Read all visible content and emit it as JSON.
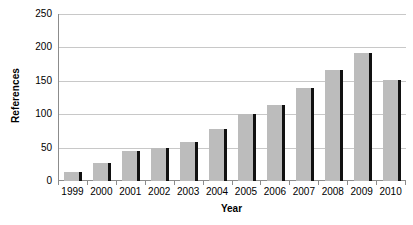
{
  "chart_data": {
    "type": "bar",
    "title": "",
    "xlabel": "Year",
    "ylabel": "References",
    "categories": [
      "1999",
      "2000",
      "2001",
      "2002",
      "2003",
      "2004",
      "2005",
      "2006",
      "2007",
      "2008",
      "2009",
      "2010"
    ],
    "values": [
      14,
      27,
      45,
      49,
      58,
      78,
      100,
      114,
      139,
      166,
      192,
      151
    ],
    "series": [
      {
        "name": "References",
        "values": [
          14,
          27,
          45,
          49,
          58,
          78,
          100,
          114,
          139,
          166,
          192,
          151
        ]
      }
    ],
    "ylim": [
      0,
      250
    ],
    "yticks": [
      0,
      50,
      100,
      150,
      200,
      250
    ],
    "ytick_labels": [
      "0",
      "50",
      "100",
      "150",
      "200",
      "250"
    ],
    "grid": true,
    "grid_axis": "y",
    "legend": false,
    "legend_position": "none",
    "bar_color": "#bcbcbc",
    "bar_shadow_color": "#111111",
    "gridline_color": "#c8c8c8",
    "axis_color": "#8c8c8c",
    "background_color": "#ffffff"
  }
}
